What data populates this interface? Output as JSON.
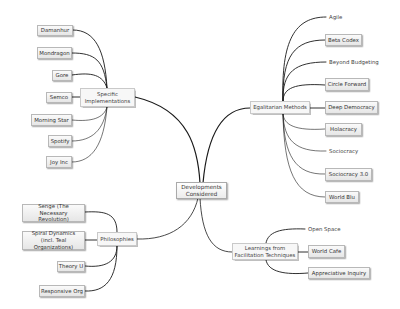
{
  "diagram": {
    "type": "mind-map",
    "center": {
      "label": "Developments Considered"
    },
    "branches": [
      {
        "label": "Specific Implementations",
        "children": [
          "Damanhur",
          "Mondragon",
          "Gore",
          "Semco",
          "Morning Star",
          "Spotify",
          "Joy Inc"
        ]
      },
      {
        "label": "Egalitarian Methods",
        "children": [
          "Agile",
          "Beta Codex",
          "Beyond Budgeting",
          "Circle Forward",
          "Deep Democracy",
          "Holacracy",
          "Sociocracy",
          "Sociocracy 3.0",
          "World Blu"
        ]
      },
      {
        "label": "Philosophies",
        "children": [
          "Senge (The Necessary Revolution)",
          "Spiral Dynamics (incl. Teal Organizations)",
          "Theory U",
          "Responsive Org"
        ]
      },
      {
        "label": "Learnings from Facilitation Techniques",
        "children": [
          "Open Space",
          "World Cafe",
          "Appreciative Inquiry"
        ]
      }
    ],
    "colors": {
      "connector": "#1a1a1a",
      "box_border": "#b8b8b8",
      "background": "#ffffff"
    }
  }
}
